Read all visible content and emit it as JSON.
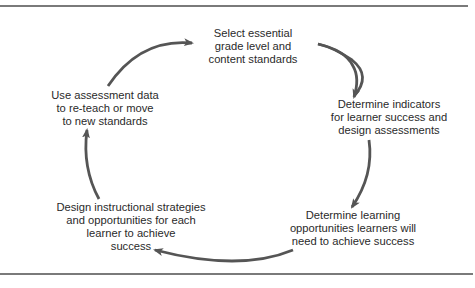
{
  "diagram": {
    "type": "cycle",
    "colors": {
      "arrow": "#555555",
      "text": "#2a2a2a",
      "rule": "#7a7a7a"
    },
    "nodes": [
      {
        "id": "select-standards",
        "lines": [
          "Select essential",
          "grade level and",
          "content standards"
        ]
      },
      {
        "id": "determine-indicators",
        "lines": [
          "Determine indicators",
          "for learner success and",
          "design assessments"
        ]
      },
      {
        "id": "determine-opportunities",
        "lines": [
          "Determine learning",
          "opportunities learners will",
          "need to achieve success"
        ]
      },
      {
        "id": "design-strategies",
        "lines": [
          "Design instructional strategies",
          "and opportunities for each",
          "learner to achieve",
          "success"
        ]
      },
      {
        "id": "use-assessment-data",
        "lines": [
          "Use assessment data",
          "to re-teach or move",
          "to new standards"
        ]
      }
    ],
    "edges": [
      {
        "from": "select-standards",
        "to": "determine-indicators"
      },
      {
        "from": "determine-indicators",
        "to": "determine-opportunities"
      },
      {
        "from": "determine-opportunities",
        "to": "design-strategies"
      },
      {
        "from": "design-strategies",
        "to": "use-assessment-data"
      },
      {
        "from": "use-assessment-data",
        "to": "select-standards"
      }
    ]
  }
}
